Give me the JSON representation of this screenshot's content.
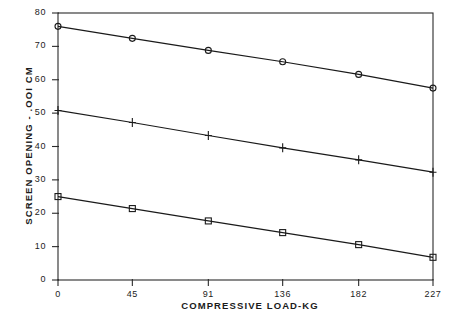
{
  "chart_data": {
    "type": "line",
    "title": "",
    "xlabel": "COMPRESSIVE LOAD-KG",
    "ylabel": "SCREEN OPENING - .OOI CM",
    "x": [
      0,
      45,
      91,
      136,
      182,
      227
    ],
    "xlim": [
      0,
      227
    ],
    "ylim": [
      0,
      80
    ],
    "xticks": [
      "0",
      "45",
      "91",
      "136",
      "182",
      "227"
    ],
    "yticks": [
      "0",
      "10",
      "20",
      "30",
      "40",
      "50",
      "60",
      "70",
      "80"
    ],
    "grid": false,
    "legend": "none",
    "series": [
      {
        "name": "upper-series",
        "marker": "circle",
        "color": "#1a1a1a",
        "values": [
          76.0,
          72.4,
          68.8,
          65.4,
          61.6,
          57.5
        ]
      },
      {
        "name": "middle-series",
        "marker": "plus",
        "color": "#1a1a1a",
        "values": [
          50.8,
          47.2,
          43.3,
          39.6,
          36.0,
          32.3
        ]
      },
      {
        "name": "lower-series",
        "marker": "square",
        "color": "#1a1a1a",
        "values": [
          25.0,
          21.4,
          17.7,
          14.2,
          10.6,
          6.8
        ]
      }
    ]
  }
}
